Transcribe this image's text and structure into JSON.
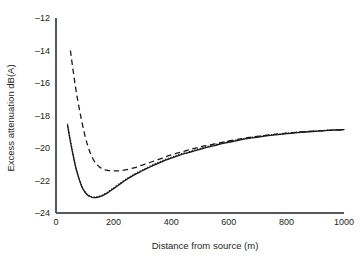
{
  "chart_data": {
    "type": "line",
    "title": "",
    "xlabel": "Distance from source (m)",
    "ylabel": "Excess attenuation dB(A)",
    "xlim": [
      0,
      1000
    ],
    "ylim": [
      -24,
      -12
    ],
    "xticks": [
      0,
      200,
      400,
      600,
      800,
      1000
    ],
    "yticks": [
      -24,
      -22,
      -20,
      -18,
      -16,
      -14,
      -12
    ],
    "xtick_labels": [
      "0",
      "200",
      "400",
      "600",
      "800",
      "1000"
    ],
    "ytick_labels": [
      "–24",
      "–22",
      "–20",
      "–18",
      "–16",
      "–14",
      "–12"
    ],
    "grid": false,
    "legend": "none",
    "series": [
      {
        "name": "solid-curve",
        "style": "solid",
        "color": "#1a1a1a",
        "x": [
          40,
          50,
          60,
          70,
          80,
          90,
          100,
          110,
          120,
          130,
          140,
          150,
          160,
          170,
          180,
          190,
          200,
          220,
          240,
          260,
          280,
          300,
          320,
          340,
          360,
          380,
          400,
          420,
          440,
          460,
          480,
          500,
          520,
          550,
          580,
          600,
          640,
          680,
          720,
          760,
          800,
          840,
          880,
          920,
          960,
          1000
        ],
        "y": [
          -18.6,
          -19.6,
          -20.5,
          -21.3,
          -21.9,
          -22.4,
          -22.7,
          -22.9,
          -23.0,
          -23.05,
          -23.05,
          -23.0,
          -22.95,
          -22.85,
          -22.75,
          -22.62,
          -22.5,
          -22.25,
          -22.0,
          -21.78,
          -21.58,
          -21.4,
          -21.22,
          -21.05,
          -20.9,
          -20.75,
          -20.62,
          -20.5,
          -20.38,
          -20.28,
          -20.18,
          -20.08,
          -19.98,
          -19.85,
          -19.72,
          -19.65,
          -19.5,
          -19.38,
          -19.28,
          -19.19,
          -19.12,
          -19.05,
          -19.0,
          -18.95,
          -18.9,
          -18.87
        ]
      },
      {
        "name": "dotted-curve",
        "style": "dotted",
        "color": "#1a1a1a",
        "x": [
          40,
          50,
          60,
          70,
          80,
          90,
          100,
          110,
          120,
          130,
          140,
          150,
          160,
          170,
          180,
          190,
          200,
          220,
          240,
          260,
          280,
          300,
          320,
          340,
          360,
          380,
          400,
          420,
          440,
          460,
          480,
          500,
          520,
          550,
          580,
          600,
          640,
          680,
          720,
          760,
          800,
          840,
          880,
          920,
          960,
          1000
        ],
        "y": [
          -18.5,
          -19.5,
          -20.45,
          -21.25,
          -21.85,
          -22.35,
          -22.68,
          -22.88,
          -22.98,
          -23.02,
          -23.0,
          -22.96,
          -22.9,
          -22.8,
          -22.7,
          -22.57,
          -22.45,
          -22.2,
          -21.95,
          -21.73,
          -21.53,
          -21.35,
          -21.17,
          -21.0,
          -20.85,
          -20.7,
          -20.57,
          -20.45,
          -20.33,
          -20.23,
          -20.13,
          -20.03,
          -19.93,
          -19.8,
          -19.68,
          -19.6,
          -19.46,
          -19.34,
          -19.24,
          -19.16,
          -19.09,
          -19.02,
          -18.97,
          -18.93,
          -18.89,
          -18.86
        ]
      },
      {
        "name": "dashed-curve",
        "style": "dashed",
        "color": "#1a1a1a",
        "x": [
          50,
          60,
          70,
          80,
          90,
          100,
          110,
          120,
          130,
          140,
          150,
          160,
          170,
          180,
          190,
          200,
          210,
          220,
          240,
          260,
          280,
          300,
          320,
          340,
          360,
          380,
          400,
          420,
          440,
          460,
          480,
          500,
          520,
          550,
          580,
          600,
          640,
          680,
          720,
          760,
          800,
          840,
          880,
          920,
          960,
          1000
        ],
        "y": [
          -14.0,
          -15.3,
          -16.5,
          -17.5,
          -18.4,
          -19.2,
          -19.85,
          -20.35,
          -20.72,
          -20.98,
          -21.15,
          -21.27,
          -21.34,
          -21.38,
          -21.4,
          -21.41,
          -21.41,
          -21.4,
          -21.35,
          -21.27,
          -21.17,
          -21.05,
          -20.93,
          -20.8,
          -20.68,
          -20.55,
          -20.43,
          -20.32,
          -20.22,
          -20.12,
          -20.03,
          -19.94,
          -19.86,
          -19.75,
          -19.64,
          -19.57,
          -19.44,
          -19.33,
          -19.24,
          -19.16,
          -19.09,
          -19.03,
          -18.98,
          -18.94,
          -18.9,
          -18.87
        ]
      }
    ]
  },
  "figure": {
    "background_color": "#ffffff",
    "axis_color": "#58595b",
    "line_color": "#1a1a1a"
  }
}
